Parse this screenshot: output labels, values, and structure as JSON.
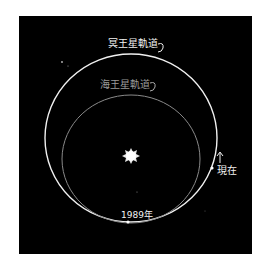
{
  "diagram": {
    "background": "#000000",
    "orbits": [
      {
        "name": "neptune-orbit",
        "label": "海王星軌道",
        "color": "#f0f0f0"
      },
      {
        "name": "pluto-orbit",
        "label": "冥王星軌道",
        "color": "#8a8a8a"
      }
    ],
    "labels": {
      "outer_orbit": "冥王星軌道",
      "inner_orbit": "海王星軌道",
      "now": "現在",
      "year": "1989年"
    },
    "center": "sun"
  }
}
